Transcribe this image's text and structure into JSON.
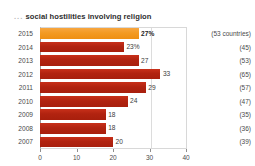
{
  "chart_data": {
    "type": "bar",
    "title": "social hostilities involving religion",
    "title_leading": "...",
    "orientation": "horizontal",
    "categories": [
      "2015",
      "2014",
      "2013",
      "2012",
      "2011",
      "2010",
      "2009",
      "2008",
      "2007"
    ],
    "values": [
      27,
      23,
      27,
      33,
      29,
      24,
      18,
      18,
      20
    ],
    "value_labels": [
      "27%",
      "23%",
      "27",
      "33",
      "29",
      "24",
      "18",
      "18",
      "20"
    ],
    "side_labels": [
      "(53 countries)",
      "(45)",
      "(53)",
      "(65)",
      "(57)",
      "(47)",
      "(35)",
      "(36)",
      "(39)"
    ],
    "highlight_index": 0,
    "xlabel": "",
    "ylabel": "",
    "xlim": [
      0,
      40
    ],
    "xticks": [
      0,
      10,
      20,
      30,
      40
    ],
    "xtick_labels": [
      "0",
      "10",
      "20",
      "30",
      "40"
    ],
    "gridlines_x": [
      30
    ],
    "grid": true,
    "legend": null,
    "colors": {
      "bar": "#b12310",
      "bar_highlight": "#f39a22",
      "axis": "#9a9a9a",
      "grid": "#dcdcdc",
      "text": "#4a4a4a",
      "title": "#2e2e2e"
    }
  }
}
